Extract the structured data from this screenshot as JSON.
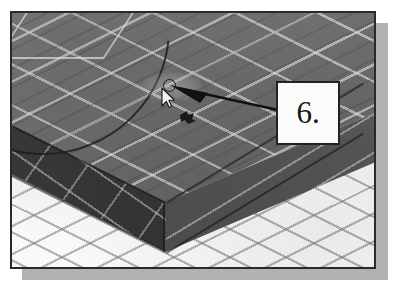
{
  "figure": {
    "kind": "cad-screenshot-figure",
    "callout": {
      "label": "6.",
      "shape": "square-box",
      "border_color": "#222222",
      "background_color": "#fbfbf9"
    },
    "leader": {
      "style": "solid-tapered-arrow",
      "color": "#111111",
      "points_to": "cursor-pick-point"
    },
    "frame": {
      "border_color": "#2a2a2a",
      "shadow_color": "#b2b2b0"
    },
    "viewport": {
      "scene": "isometric-3d-solid-on-grid-floor",
      "floor": {
        "name": "isometric-grid-floor",
        "color": "#f6f6f4",
        "grid_line_color": "#7d7d7d"
      },
      "solid": {
        "name": "rectangular-slab",
        "top_face_color": "#6d6d6b",
        "left_face_color": "#343433",
        "right_face_color": "#545452",
        "grid_line_color": "#e1e1e1"
      },
      "overlays": [
        {
          "name": "arc-construction-curve",
          "color": "#1c1c1c"
        },
        {
          "name": "diamond-construction-outline",
          "color": "#eeeeee"
        },
        {
          "name": "hover-highlight-ellipse",
          "color": "#ffffff"
        }
      ],
      "cursor": {
        "name": "arrow-pointer",
        "fill": "#ffffff",
        "outline": "#1b1b1b"
      },
      "snap_marker": {
        "name": "center-osnap-circle",
        "color": "#1d1d1d"
      },
      "drag_glyph": {
        "name": "grip-drag-glyph",
        "color": "#1b1b1b"
      }
    }
  }
}
